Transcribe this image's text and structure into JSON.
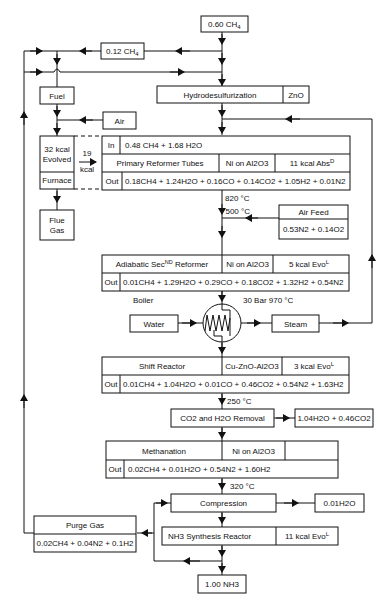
{
  "feed": {
    "label": "0.60 CH",
    "sub": "4"
  },
  "bypass": {
    "label": "0.12 CH",
    "sub": "4"
  },
  "fuel": {
    "label": "Fuel"
  },
  "air": {
    "label": "Air"
  },
  "hds": {
    "label": "Hydrodesulfurization",
    "catalyst": "ZnO"
  },
  "furnace": {
    "evolved_line1": "32 kcal",
    "evolved_line2": "Evolved",
    "label": "Furnace",
    "transfer_top": "19",
    "transfer_bottom": "kcal"
  },
  "flue": {
    "line1": "Flue",
    "line2": "Gas"
  },
  "primary": {
    "in_label": "In",
    "in_value": "0.48 CH4 + 1.68 H2O",
    "name": "Primary Reformer Tubes",
    "catalyst": "Ni on Al2O3",
    "energy": "11 kcal Abs",
    "energy_sup": "D",
    "out_label": "Out",
    "out_value": "0.18CH4 + 1.24H2O + 0.16CO + 0.14CO2 + 1.05H2 + 0.01N2",
    "temp": "820 °C"
  },
  "air_feed": {
    "label": "Air Feed",
    "value": "0.53N2 + 0.14O2",
    "temp": "500 °C"
  },
  "secondary": {
    "name": "Adiabatic Sec",
    "name_sup": "ND",
    "name_tail": " Reformer",
    "catalyst": "Ni on Al2O3",
    "energy": "5 kcal  Evo",
    "energy_sup": "L",
    "out_label": "Out",
    "out_value": "0.01CH4 + 1.29H2O + 0.29CO + 0.18CO2 + 1.32H2 + 0.54N2"
  },
  "boiler": {
    "label": "Boiler",
    "conditions": "30 Bar 970 °C",
    "water": "Water",
    "steam": "Steam"
  },
  "shift": {
    "name": "Shift Reactor",
    "catalyst": "Cu-ZnO-Al2O3",
    "energy": "3 kcal  Evo",
    "energy_sup": "L",
    "out_label": "Out",
    "out_value": "0.01CH4 + 1.04H2O + 0.01CO + 0.46CO2 + 0.54N2 + 1.63H2",
    "temp": "250 °C"
  },
  "removal": {
    "label": "CO2 and H2O Removal",
    "product": "1.04H2O + 0.46CO2"
  },
  "methanation": {
    "name": "Methanation",
    "catalyst": "Ni on Al2O3",
    "out_label": "Out",
    "out_value": "0.02CH4 + 0.01H2O + 0.54N2 + 1.60H2",
    "temp": "320 °C"
  },
  "compression": {
    "label": "Compression",
    "water_out": "0.01H2O"
  },
  "purge": {
    "label": "Purge Gas",
    "value": "0.02CH4 + 0.04N2 + 0.1H2"
  },
  "synthesis": {
    "name": "NH3 Synthesis Reactor",
    "energy": "11 kcal  Evo",
    "energy_sup": "L"
  },
  "product": {
    "label": "1.00 NH3"
  }
}
